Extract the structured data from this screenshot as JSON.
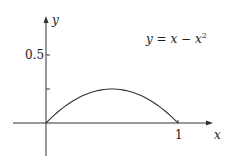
{
  "chart_data": {
    "type": "line",
    "title": "",
    "xlabel": "x",
    "ylabel": "y",
    "annotation": "y = x − x²",
    "equation": {
      "lhs": "y",
      "eq": " = ",
      "rhs": "x − x",
      "exp": "2"
    },
    "x_ticks": [
      {
        "value": 1,
        "label": "1"
      }
    ],
    "y_ticks": [
      {
        "value": 0.25,
        "label": ""
      },
      {
        "value": 0.5,
        "label": "0.5"
      }
    ],
    "xlim": [
      -0.25,
      1.2
    ],
    "ylim": [
      -0.3,
      0.85
    ],
    "grid": false,
    "series": [
      {
        "name": "y = x − x²",
        "x": [
          0,
          0.1,
          0.2,
          0.3,
          0.4,
          0.5,
          0.6,
          0.7,
          0.8,
          0.9,
          1.0
        ],
        "y": [
          0,
          0.09,
          0.16,
          0.21,
          0.24,
          0.25,
          0.24,
          0.21,
          0.16,
          0.09,
          0
        ]
      }
    ]
  }
}
